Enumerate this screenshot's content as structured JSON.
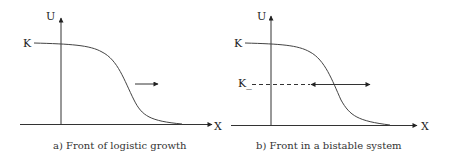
{
  "panels": [
    {
      "id": "a",
      "caption": "a) Front of logistic growth",
      "axis_x_label": "X",
      "axis_y_label": "U",
      "level_labels": [
        "K"
      ],
      "arrows": [
        "right"
      ]
    },
    {
      "id": "b",
      "caption": "b) Front in a bistable system",
      "axis_x_label": "X",
      "axis_y_label": "U",
      "level_labels": [
        "K",
        "K_"
      ],
      "arrows": [
        "left",
        "right"
      ],
      "dashed_level": "K_"
    }
  ],
  "colors": {
    "line": "#333333",
    "text": "#222222"
  }
}
